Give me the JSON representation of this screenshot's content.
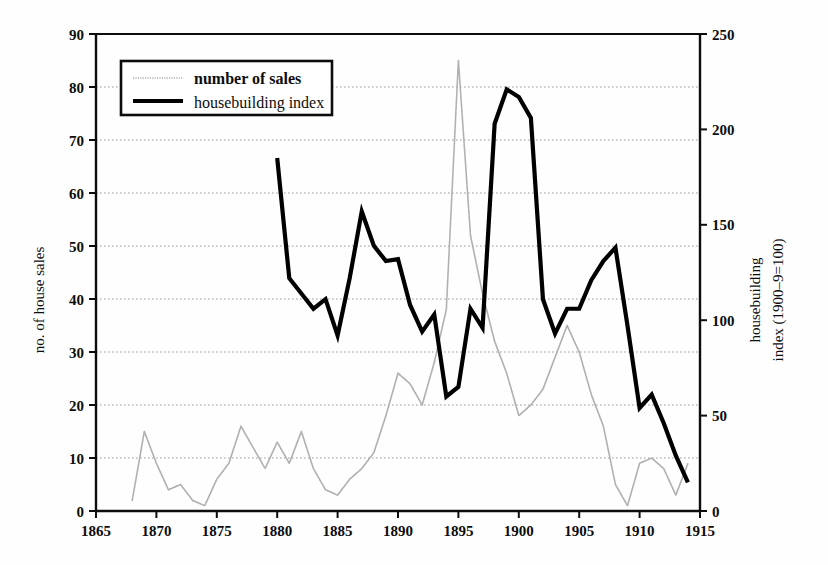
{
  "figure": {
    "background": "#fefefe",
    "ink": "#0d0d0d",
    "sales_color": "#b0b0b0",
    "index_color": "#000000",
    "grid_color": "#9a9a9a"
  },
  "chart_data": {
    "type": "line",
    "title": "",
    "xlabel": "",
    "ylabel": "no. of house sales",
    "y2label_line1": "housebuilding",
    "y2label_line2": "index (1900–9=100)",
    "xlim": [
      1865,
      1915
    ],
    "ylim": [
      0,
      90
    ],
    "y2lim": [
      0,
      250
    ],
    "xticks": [
      1865,
      1870,
      1875,
      1880,
      1885,
      1890,
      1895,
      1900,
      1905,
      1910,
      1915
    ],
    "yticks": [
      0,
      10,
      20,
      30,
      40,
      50,
      60,
      70,
      80,
      90
    ],
    "y2ticks": [
      0,
      50,
      100,
      150,
      200,
      250
    ],
    "grid": true,
    "grid_style": "dotted-horizontal",
    "legend_position": "upper-left-inside",
    "legend": [
      {
        "label": "number of sales",
        "style": "dotted-thin",
        "color": "#b0b0b0"
      },
      {
        "label": "housebuilding index",
        "style": "solid-thick",
        "color": "#000000"
      }
    ],
    "series": [
      {
        "name": "number of sales",
        "axis": "left",
        "units": "no. of house sales",
        "x": [
          1868,
          1869,
          1870,
          1871,
          1872,
          1873,
          1874,
          1875,
          1876,
          1877,
          1878,
          1879,
          1880,
          1881,
          1882,
          1883,
          1884,
          1885,
          1886,
          1887,
          1888,
          1889,
          1890,
          1891,
          1892,
          1893,
          1894,
          1895,
          1896,
          1897,
          1898,
          1899,
          1900,
          1901,
          1902,
          1903,
          1904,
          1905,
          1906,
          1907,
          1908,
          1909,
          1910,
          1911,
          1912,
          1913,
          1914
        ],
        "y": [
          2,
          15,
          9,
          4,
          5,
          2,
          1,
          6,
          9,
          16,
          12,
          8,
          13,
          9,
          15,
          8,
          4,
          3,
          6,
          8,
          11,
          18,
          26,
          24,
          20,
          28,
          38,
          85,
          52,
          41,
          32,
          26,
          18,
          20,
          23,
          29,
          35,
          30,
          22,
          16,
          5,
          1,
          9,
          10,
          8,
          3,
          9
        ]
      },
      {
        "name": "housebuilding index",
        "axis": "right",
        "units": "index (1900-9=100)",
        "x": [
          1880,
          1881,
          1882,
          1883,
          1884,
          1885,
          1886,
          1887,
          1888,
          1889,
          1890,
          1891,
          1892,
          1893,
          1894,
          1895,
          1896,
          1897,
          1898,
          1899,
          1900,
          1901,
          1902,
          1903,
          1904,
          1905,
          1906,
          1907,
          1908,
          1909,
          1910,
          1911,
          1912,
          1913,
          1914
        ],
        "y_left_scale": [
          66.5,
          44,
          41,
          38,
          40,
          33,
          44,
          56.5,
          50,
          47,
          47.5,
          39,
          34,
          37,
          21.5,
          23.5,
          38,
          34.5,
          73,
          79.5,
          78,
          74,
          40,
          33.5,
          38,
          38,
          43.5,
          47,
          49.5,
          35,
          19.5,
          22,
          16.5,
          10.5,
          5.5
        ],
        "y": [
          185,
          122,
          114,
          106,
          111,
          92,
          122,
          157,
          139,
          131,
          132,
          108,
          94,
          103,
          60,
          65,
          106,
          96,
          203,
          221,
          217,
          206,
          111,
          93,
          106,
          106,
          121,
          131,
          138,
          97,
          54,
          61,
          46,
          29,
          15
        ]
      }
    ]
  }
}
